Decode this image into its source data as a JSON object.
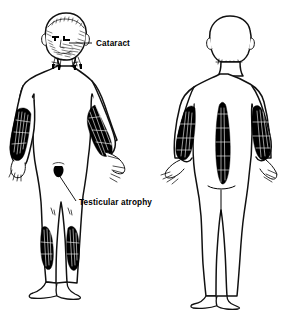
{
  "illustration": {
    "title": "Myotonic dystrophy clinical features",
    "background_color": "#ffffff",
    "ink_color": "#000000",
    "width": 298,
    "height": 310,
    "style": "black-and-white line drawing with cross-hatched shading"
  },
  "annotations": [
    {
      "id": "cataract",
      "label": "Cataract",
      "target": "eye",
      "text_x": 96,
      "text_y": 46,
      "leader_from_x": 88,
      "leader_from_y": 43,
      "leader_to_x": 69,
      "leader_to_y": 43
    },
    {
      "id": "testicular-atrophy",
      "label": "Testicular atrophy",
      "target": "groin",
      "text_x": 79,
      "text_y": 205,
      "leader_from_x": 76,
      "leader_from_y": 201,
      "leader_to_x": 57,
      "leader_to_y": 172
    }
  ],
  "figures": [
    {
      "id": "anterior-figure",
      "view": "anterior",
      "description": "Front view of standing male figure showing muscle wasting",
      "wasting_regions": [
        "temporalis",
        "masseter",
        "sternocleidomastoid",
        "forearms",
        "hands",
        "quadriceps",
        "calves"
      ]
    },
    {
      "id": "posterior-figure",
      "view": "posterior",
      "description": "Back view of standing male figure showing paraspinal and forearm wasting",
      "wasting_regions": [
        "paraspinal",
        "forearms",
        "hands"
      ]
    }
  ]
}
